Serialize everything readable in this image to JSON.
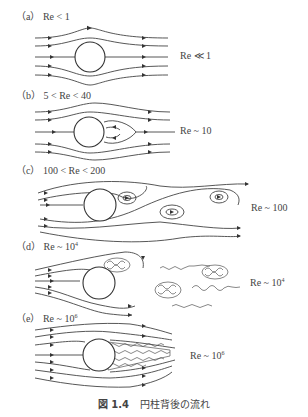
{
  "figure": {
    "caption_number": "図 1.4",
    "caption_text": "円柱背後の流れ",
    "panels": [
      {
        "id": "a",
        "label": "（a）",
        "condition": "Re < 1",
        "side_label": "Re ≪ 1",
        "side_exp": ""
      },
      {
        "id": "b",
        "label": "（b）",
        "condition": "5 < Re < 40",
        "side_label": "Re ~ 10",
        "side_exp": ""
      },
      {
        "id": "c",
        "label": "（c）",
        "condition": "100 < Re < 200",
        "side_label": "Re ~ 100",
        "side_exp": ""
      },
      {
        "id": "d",
        "label": "（d）",
        "condition_base": "Re ~ 10",
        "condition_exp": "4",
        "side_base": "Re ~ 10",
        "side_exp": "4"
      },
      {
        "id": "e",
        "label": "（e）",
        "condition_base": "Re ~ 10",
        "condition_exp": "6",
        "side_base": "Re ~ 10",
        "side_exp": "6"
      }
    ]
  }
}
